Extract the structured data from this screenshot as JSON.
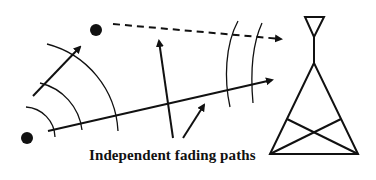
{
  "diagram": {
    "caption": "Independent fading paths",
    "colors": {
      "stroke": "#111111",
      "background": "#ffffff"
    },
    "elements": {
      "transmitter_primary": "mobile-transmitter-dot",
      "transmitter_secondary": "scatterer-dot",
      "receiver": "antenna-tower",
      "direct_path": "solid-arrow",
      "reflected_path": "dashed-arrow",
      "wavefronts": "arc-wavefronts",
      "pointer_arrows": 2
    }
  }
}
